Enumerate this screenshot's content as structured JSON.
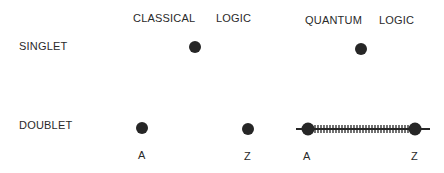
{
  "headers": {
    "classical": "CLASSICAL",
    "classical_logic": "LOGIC",
    "quantum": "QUANTUM",
    "quantum_logic": "LOGIC"
  },
  "rows": {
    "singlet": "SINGLET",
    "doublet": "DOUBLET"
  },
  "points": {
    "classical_a": "A",
    "classical_z": "Z",
    "quantum_a": "A",
    "quantum_z": "Z"
  },
  "colors": {
    "ink": "#262626",
    "background": "#ffffff"
  }
}
